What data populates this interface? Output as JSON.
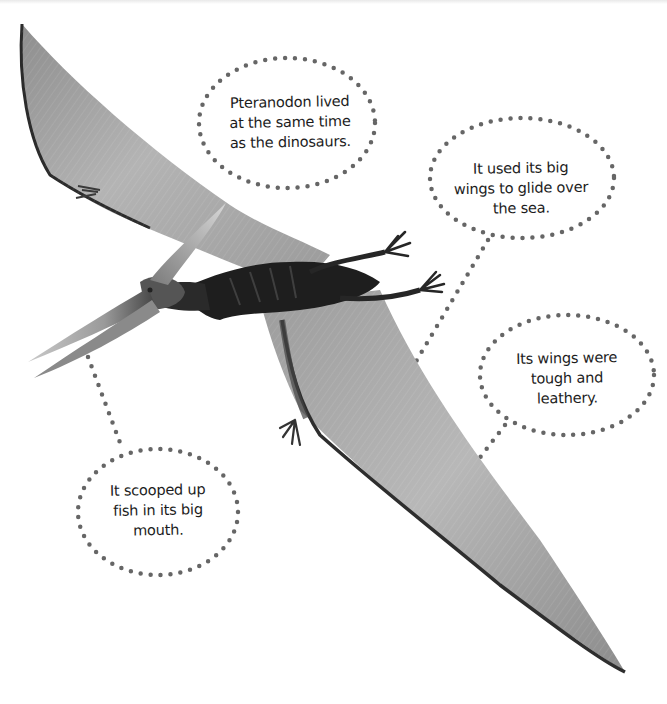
{
  "page": {
    "subject": "Pteranodon",
    "colors": {
      "background": "#ffffff",
      "dot": "#666666",
      "text": "#1d1d1d",
      "wing_light": "#a9a9a9",
      "wing_dark": "#3a3a3a",
      "body": "#1e1e1e"
    }
  },
  "callouts": [
    {
      "id": "time",
      "text": "Pteranodon lived\nat the same time\nas the dinosaurs."
    },
    {
      "id": "glide",
      "text": "It used its big\nwings to glide over\nthe sea."
    },
    {
      "id": "wings",
      "text": "Its wings were\ntough and\nleathery."
    },
    {
      "id": "fish",
      "text": "It scooped up\nfish in its big\nmouth."
    }
  ]
}
